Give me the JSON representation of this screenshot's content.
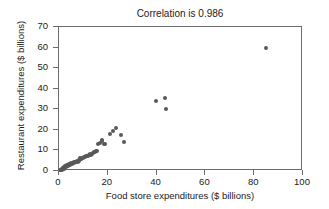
{
  "chart_data": {
    "type": "scatter",
    "title": "Correlation is 0.986",
    "xlabel": "Food store expenditures ($ billions)",
    "ylabel": "Restaurant expenditures ($ billions)",
    "xlim": [
      0,
      100
    ],
    "ylim": [
      0,
      70
    ],
    "xticks": [
      0,
      20,
      40,
      60,
      80,
      100
    ],
    "yticks": [
      0,
      10,
      20,
      30,
      40,
      50,
      60,
      70
    ],
    "xtick_labels": [
      "0",
      "20",
      "40",
      "60",
      "80",
      "100"
    ],
    "ytick_labels": [
      "0",
      "10",
      "20",
      "30",
      "40",
      "50",
      "60",
      "70"
    ],
    "grid": false,
    "legend": false,
    "marker_color": "#595959",
    "frame_color": "#6b6b6b",
    "correlation": 0.986,
    "series": [
      {
        "name": "States",
        "points": [
          [
            0.6,
            0.4
          ],
          [
            0.8,
            0.6
          ],
          [
            1.0,
            0.5
          ],
          [
            1.1,
            0.9
          ],
          [
            1.3,
            0.7
          ],
          [
            1.4,
            1.1
          ],
          [
            1.5,
            0.8
          ],
          [
            1.6,
            1.3
          ],
          [
            1.7,
            1.0
          ],
          [
            1.8,
            1.5
          ],
          [
            1.9,
            1.2
          ],
          [
            2.0,
            1.7
          ],
          [
            2.1,
            1.4
          ],
          [
            2.2,
            1.9
          ],
          [
            2.3,
            1.6
          ],
          [
            2.4,
            2.1
          ],
          [
            2.5,
            1.8
          ],
          [
            2.6,
            2.3
          ],
          [
            2.8,
            2.0
          ],
          [
            2.9,
            2.5
          ],
          [
            3.0,
            2.2
          ],
          [
            3.2,
            2.7
          ],
          [
            3.3,
            2.4
          ],
          [
            3.5,
            2.9
          ],
          [
            3.6,
            2.6
          ],
          [
            3.8,
            3.1
          ],
          [
            4.0,
            2.8
          ],
          [
            4.2,
            3.3
          ],
          [
            4.4,
            3.0
          ],
          [
            4.6,
            3.5
          ],
          [
            4.9,
            3.2
          ],
          [
            5.1,
            3.7
          ],
          [
            5.4,
            3.4
          ],
          [
            5.7,
            3.9
          ],
          [
            6.0,
            4.2
          ],
          [
            6.3,
            4.0
          ],
          [
            6.6,
            4.5
          ],
          [
            7.0,
            4.3
          ],
          [
            7.3,
            4.8
          ],
          [
            7.7,
            4.6
          ],
          [
            8.0,
            5.1
          ],
          [
            8.4,
            5.4
          ],
          [
            8.6,
            6.3
          ],
          [
            8.9,
            5.7
          ],
          [
            9.2,
            6.0
          ],
          [
            9.6,
            6.5
          ],
          [
            10.0,
            6.2
          ],
          [
            10.4,
            6.8
          ],
          [
            10.8,
            6.6
          ],
          [
            11.2,
            7.1
          ],
          [
            11.6,
            7.5
          ],
          [
            12.0,
            7.3
          ],
          [
            12.4,
            7.8
          ],
          [
            12.8,
            8.2
          ],
          [
            13.2,
            8.0
          ],
          [
            13.6,
            8.5
          ],
          [
            14.0,
            8.8
          ],
          [
            14.4,
            9.0
          ],
          [
            14.8,
            9.3
          ],
          [
            15.2,
            9.6
          ],
          [
            15.6,
            9.8
          ],
          [
            16.0,
            13.3
          ],
          [
            16.6,
            13.5
          ],
          [
            17.5,
            14.6
          ],
          [
            17.8,
            15.0
          ],
          [
            18.3,
            13.2
          ],
          [
            18.8,
            13.1
          ],
          [
            21.0,
            18.0
          ],
          [
            22.0,
            19.5
          ],
          [
            23.3,
            21.0
          ],
          [
            25.5,
            17.5
          ],
          [
            26.8,
            14.0
          ],
          [
            39.8,
            34.0
          ],
          [
            43.6,
            35.7
          ],
          [
            44.0,
            30.0
          ],
          [
            85.0,
            59.8
          ]
        ]
      }
    ]
  }
}
